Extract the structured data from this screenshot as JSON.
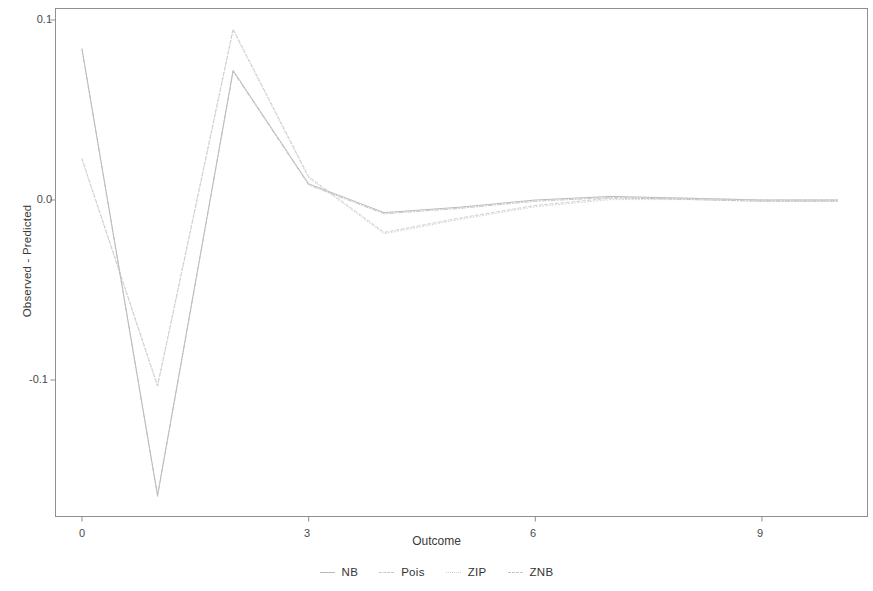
{
  "chart_data": {
    "type": "line",
    "title": "",
    "xlabel": "Outcome",
    "ylabel": "Observed - Predicted",
    "xlim": [
      0,
      10.2
    ],
    "ylim": [
      -0.175,
      0.11
    ],
    "xticks": [
      0,
      3,
      6,
      9
    ],
    "xtick_labels": [
      "0",
      "3",
      "6",
      "9"
    ],
    "yticks": [
      0.1,
      0.0,
      -0.1
    ],
    "ytick_labels": [
      "0.1",
      "0.0",
      "-0.1"
    ],
    "grid": false,
    "legend_position": "bottom",
    "x": [
      0,
      1,
      2,
      3,
      4,
      5,
      6,
      7,
      8,
      9,
      10
    ],
    "series": [
      {
        "name": "NB",
        "color": "#b0b0b0",
        "linestyle": "solid",
        "values": [
          0.084,
          -0.164,
          0.072,
          0.009,
          -0.007,
          -0.004,
          0.0,
          0.002,
          0.001,
          0.0,
          0.0
        ]
      },
      {
        "name": "Pois",
        "color": "#c6c6c6",
        "linestyle": "dashed",
        "values": [
          0.023,
          -0.103,
          0.095,
          0.013,
          -0.018,
          -0.01,
          -0.003,
          0.001,
          0.001,
          0.0,
          0.0
        ]
      },
      {
        "name": "ZIP",
        "color": "#cccccc",
        "linestyle": "dotted",
        "values": [
          0.023,
          -0.103,
          0.095,
          0.013,
          -0.018,
          -0.01,
          -0.003,
          0.001,
          0.001,
          0.0,
          0.0
        ]
      },
      {
        "name": "ZNB",
        "color": "#bcbcbc",
        "linestyle": "dotdash",
        "values": [
          0.084,
          -0.164,
          0.072,
          0.009,
          -0.007,
          -0.004,
          0.0,
          0.002,
          0.001,
          0.0,
          0.0
        ]
      }
    ]
  },
  "axes": {
    "y_title": "Observed - Predicted",
    "x_title": "Outcome",
    "y_tick_labels": [
      "0.1",
      "0.0",
      "-0.1"
    ],
    "x_tick_labels": [
      "0",
      "3",
      "6",
      "9"
    ]
  },
  "legend": {
    "items": [
      {
        "label": "NB"
      },
      {
        "label": "Pois"
      },
      {
        "label": "ZIP"
      },
      {
        "label": "ZNB"
      }
    ]
  }
}
